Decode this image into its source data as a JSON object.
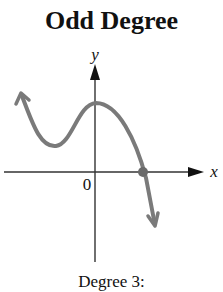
{
  "title": "Odd Degree",
  "caption": "Degree 3:",
  "axes": {
    "x_label": "x",
    "y_label": "y",
    "origin_label": "0"
  },
  "colors": {
    "axis": "#222222",
    "curve": "#7a7a7a",
    "point": "#6a6a6a"
  }
}
